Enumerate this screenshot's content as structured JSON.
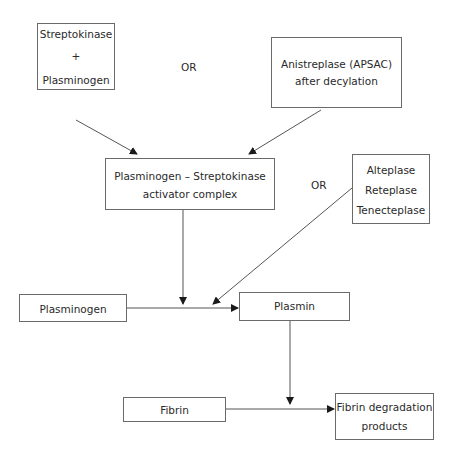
{
  "diagram": {
    "nodes": {
      "streptokinase": {
        "lines": [
          "Streptokinase",
          "+",
          "Plasminogen"
        ]
      },
      "anistreplase": {
        "lines": [
          "Anistreplase (APSAC)",
          "after decylation"
        ]
      },
      "complex": {
        "lines": [
          "Plasminogen – Streptokinase",
          "activator complex"
        ]
      },
      "tpa": {
        "lines": [
          "Alteplase",
          "Reteplase",
          "Tenecteplase"
        ]
      },
      "plasminogen": {
        "lines": [
          "Plasminogen"
        ]
      },
      "plasmin": {
        "lines": [
          "Plasmin"
        ]
      },
      "fibrin": {
        "lines": [
          "Fibrin"
        ]
      },
      "fdp": {
        "lines": [
          "Fibrin degradation",
          "products"
        ]
      }
    },
    "labels": {
      "or_top": "OR",
      "or_middle": "OR"
    },
    "edges": [
      {
        "from": "streptokinase",
        "to": "complex"
      },
      {
        "from": "anistreplase",
        "to": "complex"
      },
      {
        "from": "complex",
        "to": "plasminogen-plasmin-conversion"
      },
      {
        "from": "tpa",
        "to": "plasminogen-plasmin-conversion"
      },
      {
        "from": "plasminogen",
        "to": "plasmin"
      },
      {
        "from": "plasmin",
        "to": "fibrin-fdp-conversion"
      },
      {
        "from": "fibrin",
        "to": "fdp"
      }
    ],
    "colors": {
      "line": "#555555",
      "border": "#6a6a6a",
      "text": "#2a2a2a"
    }
  }
}
